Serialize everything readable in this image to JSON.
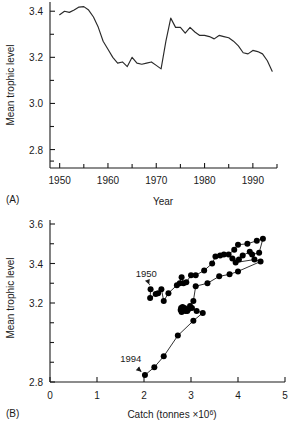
{
  "figure": {
    "panel_a_label": "(A)",
    "panel_b_label": "(B)"
  },
  "chart_data": [
    {
      "id": "panel-a",
      "type": "line",
      "title": "",
      "xlabel": "Year",
      "ylabel": "Mean trophic level",
      "xlim": [
        1948,
        1995
      ],
      "ylim": [
        2.72,
        3.44
      ],
      "grid": false,
      "legend": null,
      "xticklabels": [
        "1950",
        "1960",
        "1970",
        "1980",
        "1990"
      ],
      "xticks": [
        1950,
        1960,
        1970,
        1980,
        1990
      ],
      "xminorticks": [
        1955,
        1965,
        1975,
        1985,
        1995
      ],
      "yticklabels": [
        "3.4",
        "3.2",
        "3.0",
        "2.8"
      ],
      "yticks": [
        3.4,
        3.2,
        3.0,
        2.8
      ],
      "yminorticks": [
        3.3,
        3.1,
        2.9,
        2.75
      ],
      "x": [
        1950,
        1951,
        1952,
        1953,
        1954,
        1955,
        1956,
        1957,
        1958,
        1959,
        1960,
        1961,
        1962,
        1963,
        1964,
        1965,
        1966,
        1967,
        1968,
        1969,
        1970,
        1971,
        1972,
        1973,
        1974,
        1975,
        1976,
        1977,
        1978,
        1979,
        1980,
        1981,
        1982,
        1983,
        1984,
        1985,
        1986,
        1987,
        1988,
        1989,
        1990,
        1991,
        1992,
        1993,
        1994
      ],
      "y": [
        3.385,
        3.4,
        3.395,
        3.405,
        3.418,
        3.42,
        3.405,
        3.375,
        3.33,
        3.27,
        3.235,
        3.2,
        3.175,
        3.18,
        3.16,
        3.2,
        3.175,
        3.17,
        3.175,
        3.18,
        3.165,
        3.15,
        3.27,
        3.37,
        3.33,
        3.33,
        3.305,
        3.33,
        3.31,
        3.295,
        3.295,
        3.29,
        3.28,
        3.295,
        3.29,
        3.285,
        3.27,
        3.25,
        3.22,
        3.215,
        3.23,
        3.225,
        3.215,
        3.185,
        3.14
      ]
    },
    {
      "id": "panel-b",
      "type": "scatter",
      "title": "",
      "xlabel": "Catch (tonnes ×10⁶)",
      "ylabel": "Mean trophic level",
      "xlim": [
        0,
        5
      ],
      "ylim": [
        2.8,
        3.6
      ],
      "grid": false,
      "legend": null,
      "xticklabels": [
        "0",
        "1",
        "2",
        "3",
        "4",
        "5"
      ],
      "xticks": [
        0,
        1,
        2,
        3,
        4,
        5
      ],
      "yticklabels": [
        "3.6",
        "3.4",
        "3.2",
        "2.8"
      ],
      "yticks": [
        3.6,
        3.4,
        3.2,
        2.8
      ],
      "yminorticks": [
        3.5,
        3.3,
        3.1,
        3.0,
        2.9
      ],
      "connected": true,
      "annotations": [
        {
          "text": "1950",
          "x": 2.05,
          "y": 3.33,
          "points_to_x": 2.15,
          "points_to_y": 3.27
        },
        {
          "text": "1994",
          "x": 1.72,
          "y": 2.9,
          "points_to_x": 2.02,
          "points_to_y": 2.835
        }
      ],
      "points": [
        {
          "x": 2.14,
          "y": 3.27
        },
        {
          "x": 2.13,
          "y": 3.225
        },
        {
          "x": 2.25,
          "y": 3.245
        },
        {
          "x": 2.3,
          "y": 3.25
        },
        {
          "x": 2.37,
          "y": 3.27
        },
        {
          "x": 2.42,
          "y": 3.21
        },
        {
          "x": 2.52,
          "y": 3.25
        },
        {
          "x": 2.7,
          "y": 3.29
        },
        {
          "x": 2.76,
          "y": 3.3
        },
        {
          "x": 2.8,
          "y": 3.33
        },
        {
          "x": 2.84,
          "y": 3.3
        },
        {
          "x": 2.9,
          "y": 3.305
        },
        {
          "x": 3.0,
          "y": 3.34
        },
        {
          "x": 3.1,
          "y": 3.34
        },
        {
          "x": 3.28,
          "y": 3.365
        },
        {
          "x": 3.45,
          "y": 3.4
        },
        {
          "x": 3.52,
          "y": 3.435
        },
        {
          "x": 3.62,
          "y": 3.44
        },
        {
          "x": 3.7,
          "y": 3.445
        },
        {
          "x": 3.8,
          "y": 3.445
        },
        {
          "x": 3.92,
          "y": 3.47
        },
        {
          "x": 4.0,
          "y": 3.495
        },
        {
          "x": 4.2,
          "y": 3.5
        },
        {
          "x": 4.4,
          "y": 3.515
        },
        {
          "x": 4.53,
          "y": 3.525
        },
        {
          "x": 4.45,
          "y": 3.455
        },
        {
          "x": 4.3,
          "y": 3.445
        },
        {
          "x": 4.25,
          "y": 3.46
        },
        {
          "x": 4.1,
          "y": 3.44
        },
        {
          "x": 4.02,
          "y": 3.42
        },
        {
          "x": 3.88,
          "y": 3.425
        },
        {
          "x": 3.95,
          "y": 3.405
        },
        {
          "x": 4.35,
          "y": 3.42
        },
        {
          "x": 4.48,
          "y": 3.41
        },
        {
          "x": 4.0,
          "y": 3.36
        },
        {
          "x": 3.82,
          "y": 3.345
        },
        {
          "x": 3.6,
          "y": 3.335
        },
        {
          "x": 3.35,
          "y": 3.3
        },
        {
          "x": 3.1,
          "y": 3.285
        },
        {
          "x": 3.05,
          "y": 3.21
        },
        {
          "x": 2.98,
          "y": 3.185
        },
        {
          "x": 2.95,
          "y": 3.17
        },
        {
          "x": 2.92,
          "y": 3.16
        },
        {
          "x": 2.86,
          "y": 3.175
        },
        {
          "x": 2.82,
          "y": 3.18
        },
        {
          "x": 2.79,
          "y": 3.175
        },
        {
          "x": 2.78,
          "y": 3.165
        },
        {
          "x": 2.8,
          "y": 3.155
        },
        {
          "x": 2.88,
          "y": 3.16
        },
        {
          "x": 3.02,
          "y": 3.175
        },
        {
          "x": 3.12,
          "y": 3.16
        },
        {
          "x": 3.25,
          "y": 3.15
        },
        {
          "x": 3.05,
          "y": 3.11
        },
        {
          "x": 2.72,
          "y": 3.035
        },
        {
          "x": 2.42,
          "y": 2.93
        },
        {
          "x": 2.22,
          "y": 2.875
        },
        {
          "x": 2.02,
          "y": 2.835
        }
      ]
    }
  ]
}
